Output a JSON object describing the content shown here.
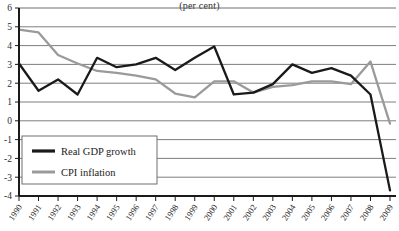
{
  "chart_data": {
    "type": "line",
    "title": "(per cent)",
    "xlabel": "",
    "ylabel": "",
    "ylim": [
      -4,
      6
    ],
    "yticks": [
      6,
      5,
      4,
      3,
      2,
      1,
      0,
      -1,
      -2,
      -3,
      -4
    ],
    "grid": true,
    "legend_position": "lower-left",
    "categories": [
      "1990",
      "1991",
      "1992",
      "1993",
      "1994",
      "1995",
      "1996",
      "1997",
      "1998",
      "1999",
      "2000",
      "2001",
      "2002",
      "2003",
      "2004",
      "2005",
      "2006",
      "2007",
      "2008",
      "2009"
    ],
    "series": [
      {
        "name": "Real GDP growth",
        "color": "#1a1a1a",
        "values": [
          3.05,
          1.6,
          2.2,
          1.4,
          3.35,
          2.85,
          3.0,
          3.35,
          2.7,
          3.35,
          3.95,
          1.4,
          1.5,
          1.95,
          3.0,
          2.55,
          2.8,
          2.4,
          1.4,
          -3.7
        ]
      },
      {
        "name": "CPI inflation",
        "color": "#9a9a9a",
        "values": [
          4.85,
          4.7,
          3.5,
          3.05,
          2.65,
          2.55,
          2.4,
          2.2,
          1.45,
          1.25,
          2.1,
          2.1,
          1.5,
          1.8,
          1.9,
          2.1,
          2.1,
          1.95,
          3.15,
          -0.15
        ]
      }
    ]
  },
  "legend": {
    "items": [
      {
        "label": "Real GDP growth",
        "color": "#1a1a1a"
      },
      {
        "label": "CPI inflation",
        "color": "#9a9a9a"
      }
    ]
  },
  "colors": {
    "gdp": "#1a1a1a",
    "cpi": "#9a9a9a",
    "grid": "#6f6f6f",
    "axis": "#1a1a1a",
    "background": "#ffffff"
  }
}
